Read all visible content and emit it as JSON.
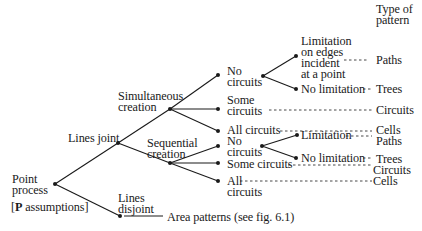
{
  "diagram": {
    "column_header": "Type of\npattern",
    "root": {
      "label": "Point\nprocess",
      "note_bold": "P",
      "note_rest": " assumptions]",
      "note_open": "["
    },
    "lines_joint": {
      "label": "Lines joint",
      "simultaneous": {
        "label": "Simultaneous\ncreation",
        "no_circuits": {
          "label": "No\ncircuits",
          "limitation": {
            "label": "Limitation\non edges\nincident\nat a point",
            "pattern": "Paths"
          },
          "no_limitation": {
            "label": "No limitation",
            "pattern": "Trees"
          }
        },
        "some_circuits": {
          "label": "Some\ncircuits",
          "pattern": "Circuits"
        },
        "all_circuits": {
          "label": "All circuits",
          "pattern": "Cells"
        }
      },
      "sequential": {
        "label": "Sequential\ncreation",
        "no_circuits": {
          "label": "No\ncircuits",
          "limitation": {
            "label": "Limitation",
            "pattern": "Paths"
          },
          "no_limitation": {
            "label": "No limitation",
            "pattern": "Trees"
          }
        },
        "some_circuits": {
          "label": "Some circuits",
          "pattern": "Circuits"
        },
        "all_circuits": {
          "label": "All\ncircuits",
          "pattern": "Cells"
        }
      }
    },
    "lines_disjoint": {
      "label": "Lines\ndisjoint",
      "result": "Area patterns (see fig. 6.1)"
    }
  }
}
